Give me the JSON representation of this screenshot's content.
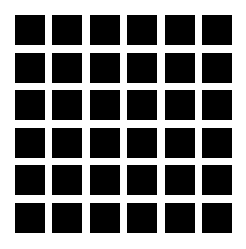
{
  "figure": {
    "type": "hermann-grid",
    "rows": 6,
    "columns": 6,
    "square_color": "#000000",
    "background_color": "#ffffff"
  }
}
